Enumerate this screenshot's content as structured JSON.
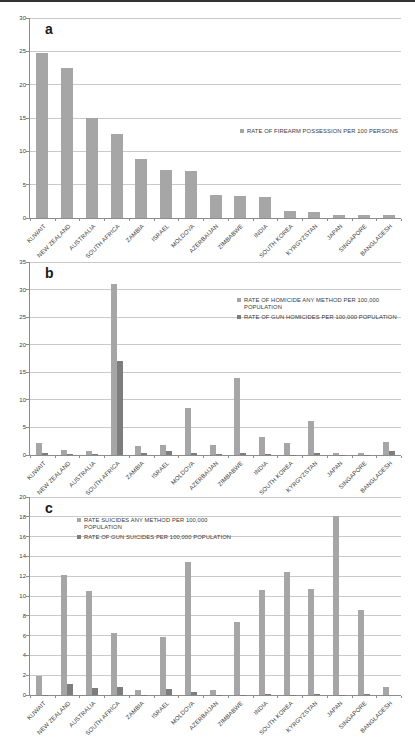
{
  "figure": {
    "panel_labels": [
      "a",
      "b",
      "c"
    ]
  },
  "colors": {
    "series_primary": "#a6a6a6",
    "series_secondary": "#7d7d7d",
    "gridline": "#c9c9c9",
    "axis": "#8c8c8c",
    "text": "#3a3a3a",
    "top_rule": "#333333",
    "background": "#ffffff"
  },
  "chart_data": [
    {
      "panel_label": "a",
      "type": "bar",
      "title": "",
      "xlabel": "",
      "ylabel": "",
      "grid": true,
      "legend_position": "middle-right",
      "ylim": [
        0,
        30
      ],
      "ytick_step": 5,
      "categories": [
        "KUWAIT",
        "NEW ZEALAND",
        "AUSTRALIA",
        "SOUTH AFRICA",
        "ZAMBIA",
        "ISRAEL",
        "MOLDOVA",
        "AZERBAIJAN",
        "ZIMBABWE",
        "INDIA",
        "SOUTH KOREA",
        "KYRGYZSTAN",
        "JAPAN",
        "SINGAPORE",
        "BANGLADESH"
      ],
      "series": [
        {
          "name": "RATE OF FIREARM POSSESSION PER 100 PERSONS",
          "legend_lines": [
            "RATE OF FIREARM POSSESSION PER 100 PERSONS"
          ],
          "color": "#a6a6a6",
          "values": [
            24.8,
            22.5,
            15.0,
            12.6,
            8.8,
            7.2,
            7.0,
            3.4,
            3.3,
            3.1,
            1.1,
            0.9,
            0.5,
            0.4,
            0.4
          ]
        }
      ]
    },
    {
      "panel_label": "b",
      "type": "bar",
      "title": "",
      "xlabel": "",
      "ylabel": "",
      "grid": true,
      "legend_position": "top-right",
      "ylim": [
        0,
        35
      ],
      "ytick_step": 5,
      "categories": [
        "KUWAIT",
        "NEW ZEALAND",
        "AUSTRALIA",
        "SOUTH AFRICA",
        "ZAMBIA",
        "ISRAEL",
        "MOLDOVA",
        "AZERBAIJAN",
        "ZIMBABWE",
        "INDIA",
        "SOUTH KOREA",
        "KYRGYZSTAN",
        "JAPAN",
        "SINGAPORE",
        "BANGLADESH"
      ],
      "series": [
        {
          "name": "RATE OF HOMICIDE ANY METHOD PER 100,000 POPULATION",
          "legend_lines": [
            "RATE OF HOMICIDE ANY METHOD PER 100,000",
            "POPULATION"
          ],
          "color": "#a6a6a6",
          "values": [
            2.2,
            0.9,
            0.8,
            31.0,
            1.7,
            1.9,
            8.5,
            1.9,
            14.0,
            3.2,
            2.2,
            6.1,
            0.3,
            0.35,
            2.3
          ]
        },
        {
          "name": "RATE OF GUN HOMICIDES PER 100,000 POPULATION",
          "legend_lines": [
            "RATE OF GUN HOMICIDES PER 100,000 POPULATION"
          ],
          "color": "#7d7d7d",
          "values": [
            0.4,
            0.2,
            0.15,
            17.0,
            0.4,
            0.8,
            0.3,
            0.1,
            0.3,
            0.15,
            0.05,
            0.3,
            0.02,
            0.02,
            0.7
          ]
        }
      ]
    },
    {
      "panel_label": "c",
      "type": "bar",
      "title": "",
      "xlabel": "",
      "ylabel": "",
      "grid": true,
      "legend_position": "top-left",
      "ylim": [
        0,
        20
      ],
      "ytick_step": 2,
      "categories": [
        "KUWAIT",
        "NEW ZEALAND",
        "AUSTRALIA",
        "SOUTH AFRICA",
        "ZAMBIA",
        "ISRAEL",
        "MOLDOVA",
        "AZERBAIJAN",
        "ZIMBABWE",
        "INDIA",
        "SOUTH KOREA",
        "KYRGYZSTAN",
        "JAPAN",
        "SINGAPORE",
        "BANGLADESH"
      ],
      "series": [
        {
          "name": "RATE SUICIDES ANY METHOD PER 100,000 POPULATION",
          "legend_lines": [
            "RATE SUICIDES ANY METHOD PER 100,000",
            "POPULATION"
          ],
          "color": "#a6a6a6",
          "values": [
            1.9,
            12.1,
            10.5,
            6.3,
            0.5,
            5.9,
            13.4,
            0.5,
            7.4,
            10.6,
            12.4,
            10.7,
            18.1,
            8.6,
            0.8
          ]
        },
        {
          "name": "RATE OF GUN SUICIDES PER 100,000 POPULATION",
          "legend_lines": [
            "RATE OF GUN SUICIDES PER 100,000 POPULATION"
          ],
          "color": "#7d7d7d",
          "values": [
            0.05,
            1.1,
            0.7,
            0.8,
            0.05,
            0.6,
            0.3,
            0.05,
            0.05,
            0.1,
            0.05,
            0.1,
            0.05,
            0.1,
            0
          ]
        }
      ]
    }
  ]
}
